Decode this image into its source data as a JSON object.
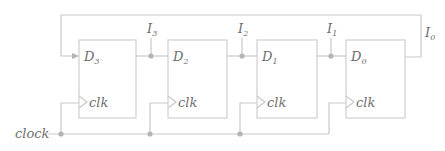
{
  "diagram": {
    "type": "shift-register",
    "flipflops": [
      {
        "d_label": "D",
        "d_sub": "3",
        "clk_label": "clk"
      },
      {
        "d_label": "D",
        "d_sub": "2",
        "clk_label": "clk"
      },
      {
        "d_label": "D",
        "d_sub": "1",
        "clk_label": "clk"
      },
      {
        "d_label": "D",
        "d_sub": "0",
        "clk_label": "clk"
      }
    ],
    "outputs": [
      {
        "label": "I",
        "sub": "3"
      },
      {
        "label": "I",
        "sub": "2"
      },
      {
        "label": "I",
        "sub": "1"
      },
      {
        "label": "I",
        "sub": "0"
      }
    ],
    "clock_label": "clock"
  }
}
